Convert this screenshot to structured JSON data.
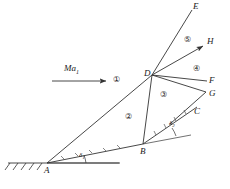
{
  "figure": {
    "type": "shock-interaction-schematic",
    "stroke_color": "#333333",
    "background": "#ffffff"
  },
  "flow": {
    "mach_label": "Ma",
    "mach_subscript": "1",
    "arrow_name": "freestream-arrow"
  },
  "points": [
    {
      "id": "A",
      "label": "A",
      "x": 47,
      "y": 163
    },
    {
      "id": "B",
      "label": "B",
      "x": 143,
      "y": 144
    },
    {
      "id": "C",
      "label": "C",
      "x": 197,
      "y": 112
    },
    {
      "id": "D",
      "label": "D",
      "x": 152,
      "y": 75
    },
    {
      "id": "E",
      "label": "E",
      "x": 195,
      "y": 7
    },
    {
      "id": "F",
      "label": "F",
      "x": 212,
      "y": 82
    },
    {
      "id": "G",
      "label": "G",
      "x": 212,
      "y": 95
    },
    {
      "id": "H",
      "label": "H",
      "x": 210,
      "y": 43
    }
  ],
  "regions": [
    {
      "id": "1",
      "label": "①",
      "x": 113,
      "y": 75
    },
    {
      "id": "2",
      "label": "②",
      "x": 125,
      "y": 112
    },
    {
      "id": "3",
      "label": "③",
      "x": 160,
      "y": 90
    },
    {
      "id": "4",
      "label": "④",
      "x": 193,
      "y": 64
    },
    {
      "id": "5",
      "label": "⑤",
      "x": 184,
      "y": 35
    }
  ],
  "angles": [
    {
      "id": "delta1",
      "symbol": "δ",
      "subscript": "1",
      "x": 79,
      "y": 152
    },
    {
      "id": "delta2",
      "symbol": "δ",
      "subscript": "2",
      "x": 171,
      "y": 120
    }
  ]
}
